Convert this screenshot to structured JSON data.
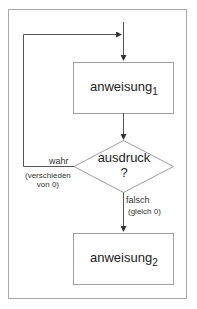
{
  "diagram": {
    "type": "flowchart",
    "colors": {
      "frame": "#a8a8a8",
      "lines": "#555555",
      "box_border": "#a0a0a0",
      "text": "#222222"
    },
    "nodes": {
      "statement1": {
        "label": "anweisung",
        "subscript": "1"
      },
      "condition": {
        "label": "ausdruck",
        "question_mark": "?"
      },
      "statement2": {
        "label": "anweisung",
        "subscript": "2"
      }
    },
    "edges": {
      "true_branch": {
        "label": "wahr",
        "note_line1": "(verschieden",
        "note_line2": "von 0)"
      },
      "false_branch": {
        "label": "falsch",
        "note": "(gleich 0)"
      }
    }
  }
}
